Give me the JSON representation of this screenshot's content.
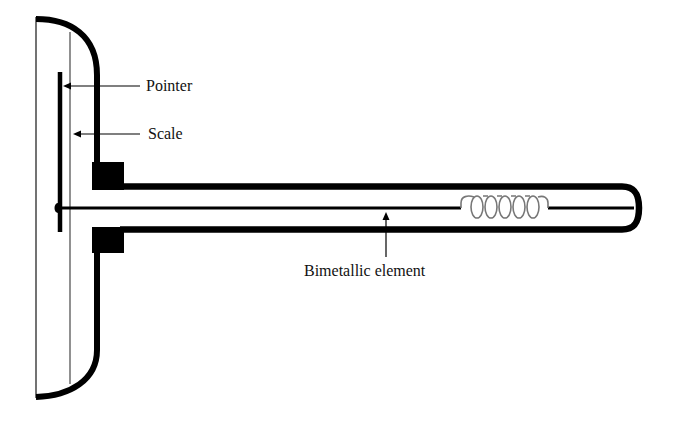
{
  "diagram": {
    "type": "bimetallic thermometer cross-section",
    "labels": {
      "pointer": "Pointer",
      "scale": "Scale",
      "bimetallic_element": "Bimetallic element"
    },
    "colors": {
      "stroke": "#000000",
      "thin_stroke": "#555555",
      "coil": "#777777",
      "background": "#ffffff",
      "text": "#111111"
    }
  }
}
